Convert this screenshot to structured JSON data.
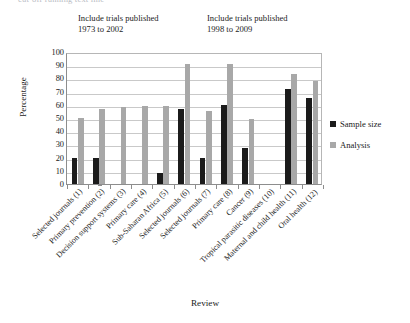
{
  "top_strip_ghost_text": "cut-off running text line",
  "captions": {
    "left": [
      "Include trials published",
      "1973 to 2002"
    ],
    "right": [
      "Include trials published",
      "1998 to 2009"
    ]
  },
  "legend": {
    "items": [
      {
        "label": "Sample size",
        "color": "#1b1b1b"
      },
      {
        "label": "Analysis",
        "color": "#a8a8a8"
      }
    ]
  },
  "chart_data": {
    "type": "bar",
    "title": "",
    "xlabel": "Review",
    "ylabel": "Percentage",
    "ylim": [
      0,
      100
    ],
    "ytick_step": 10,
    "ytick_labels": [
      "100",
      "90",
      "80",
      "70",
      "60",
      "50",
      "40",
      "30",
      "20",
      "10",
      "0"
    ],
    "grid": true,
    "legend_position": "right",
    "categories": [
      "Selected journals (1)",
      "Primary prevention (2)",
      "Decision support systems (3)",
      "Primary care (4)",
      "Sub-Saharan Africa (5)",
      "Selected journals (6)",
      "Selected journals (7)",
      "Primary care (8)",
      "Cancer (9)",
      "Tropical parasitic diseases (10)",
      "Maternal and child health (11)",
      "Oral health (12)"
    ],
    "series": [
      {
        "name": "Sample size",
        "color": "#1b1b1b",
        "values": [
          20,
          20,
          0,
          0,
          8,
          57,
          20,
          60,
          27,
          0,
          72,
          65
        ]
      },
      {
        "name": "Analysis",
        "color": "#a8a8a8",
        "values": [
          50,
          57,
          58,
          59,
          59,
          91,
          55,
          91,
          49,
          0,
          83,
          78
        ]
      }
    ],
    "annotations": [
      {
        "text": "Include trials published 1973 to 2002",
        "applies_to": "categories 1-7"
      },
      {
        "text": "Include trials published 1998 to 2009",
        "applies_to": "categories 8-12"
      }
    ]
  }
}
